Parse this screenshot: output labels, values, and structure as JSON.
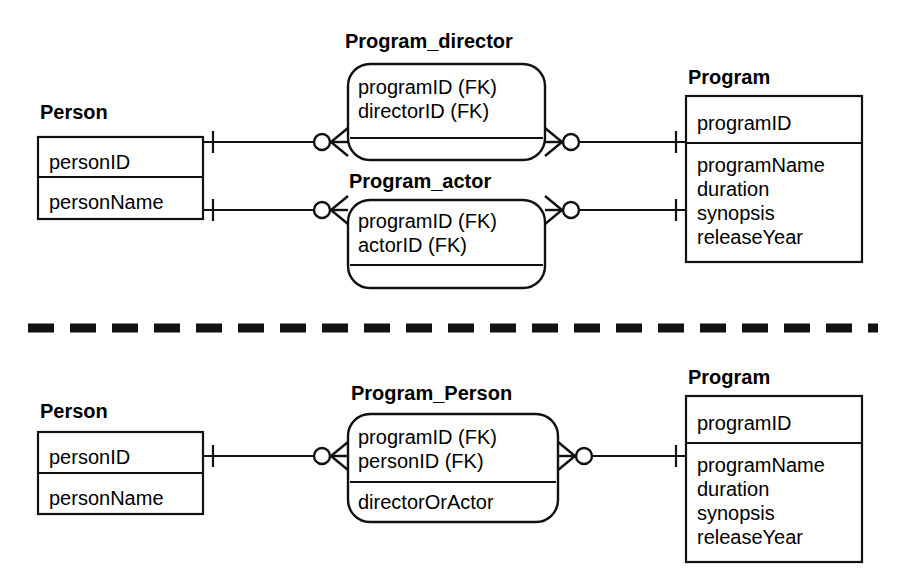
{
  "diagram": {
    "notation": "crow's foot",
    "colors": {
      "stroke": "#111111",
      "background": "#ffffff",
      "text": "#000000"
    },
    "separator": {
      "style": "dashed",
      "name": "design-separator"
    }
  },
  "top_design": {
    "entities": {
      "person": {
        "title": "Person",
        "shape": "rectangle",
        "sections": [
          {
            "attributes": [
              "personID"
            ]
          },
          {
            "attributes": [
              "personName"
            ]
          }
        ]
      },
      "program_director": {
        "title": "Program_director",
        "shape": "rounded-rectangle",
        "sections": [
          {
            "attributes": [
              "programID (FK)",
              "directorID (FK)"
            ]
          },
          {
            "attributes": []
          }
        ]
      },
      "program_actor": {
        "title": "Program_actor",
        "shape": "rounded-rectangle",
        "sections": [
          {
            "attributes": [
              "programID (FK)",
              "actorID (FK)"
            ]
          },
          {
            "attributes": []
          }
        ]
      },
      "program": {
        "title": "Program",
        "shape": "rectangle",
        "sections": [
          {
            "attributes": [
              "programID"
            ]
          },
          {
            "attributes": [
              "programName",
              "duration",
              "synopsis",
              "releaseYear"
            ]
          }
        ]
      }
    },
    "relationships": [
      {
        "name": "person-to-program-director",
        "from": "Person",
        "to": "Program_director",
        "from_cardinality": "one",
        "to_cardinality": "zero-or-many"
      },
      {
        "name": "program-director-to-program",
        "from": "Program_director",
        "to": "Program",
        "from_cardinality": "zero-or-many",
        "to_cardinality": "one"
      },
      {
        "name": "person-to-program-actor",
        "from": "Person",
        "to": "Program_actor",
        "from_cardinality": "one",
        "to_cardinality": "zero-or-many"
      },
      {
        "name": "program-actor-to-program",
        "from": "Program_actor",
        "to": "Program",
        "from_cardinality": "zero-or-many",
        "to_cardinality": "one"
      }
    ]
  },
  "bottom_design": {
    "entities": {
      "person": {
        "title": "Person",
        "shape": "rectangle",
        "sections": [
          {
            "attributes": [
              "personID"
            ]
          },
          {
            "attributes": [
              "personName"
            ]
          }
        ]
      },
      "program_person": {
        "title": "Program_Person",
        "shape": "rounded-rectangle",
        "sections": [
          {
            "attributes": [
              "programID (FK)",
              "personID (FK)"
            ]
          },
          {
            "attributes": [
              "directorOrActor"
            ]
          }
        ]
      },
      "program": {
        "title": "Program",
        "shape": "rectangle",
        "sections": [
          {
            "attributes": [
              "programID"
            ]
          },
          {
            "attributes": [
              "programName",
              "duration",
              "synopsis",
              "releaseYear"
            ]
          }
        ]
      }
    },
    "relationships": [
      {
        "name": "person-to-program-person",
        "from": "Person",
        "to": "Program_Person",
        "from_cardinality": "one",
        "to_cardinality": "zero-or-many"
      },
      {
        "name": "program-person-to-program",
        "from": "Program_Person",
        "to": "Program",
        "from_cardinality": "zero-or-many",
        "to_cardinality": "one"
      }
    ]
  }
}
